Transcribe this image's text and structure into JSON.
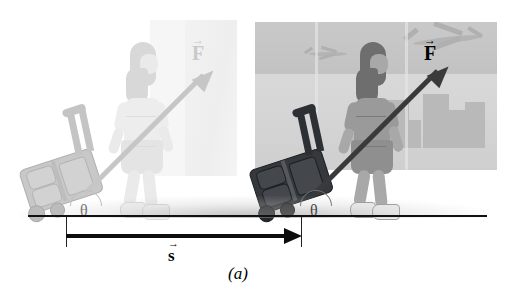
{
  "figure": {
    "caption": "(a)",
    "ground_line_color": "#111111"
  },
  "labels": {
    "force_before": "F",
    "force_after": "F",
    "displacement": "s",
    "theta_before": "θ",
    "theta_after": "θ",
    "vector_bar": "→"
  },
  "colors": {
    "ghost_tone": "#c6c6c6",
    "solid_tone": "#3a3a3a",
    "panel_solid": "#d6d6d6",
    "panel_ghost": "#f1f1f1",
    "suitcase_solid": "#35383c",
    "suitcase_ghost": "#c8c8c8",
    "ink": "#000000"
  },
  "scene": {
    "before": {
      "name": "initial-position",
      "style": "faded-ghost",
      "force_angle_deg": 45,
      "theta_label": "θ"
    },
    "after": {
      "name": "final-position",
      "style": "solid",
      "force_angle_deg": 45,
      "theta_label": "θ"
    }
  },
  "background": {
    "window_scene": "airport-window",
    "elements": [
      "airplane",
      "airplane",
      "city-skyline",
      "horizon-band"
    ]
  }
}
